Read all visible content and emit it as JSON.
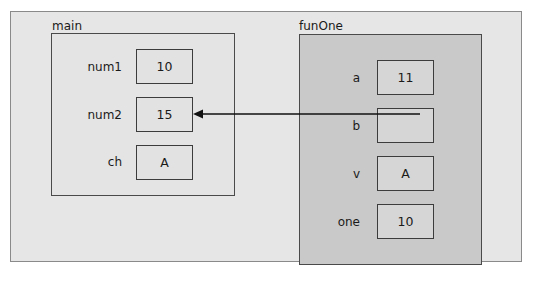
{
  "diagram": {
    "type": "memory-stack-frames",
    "frames": [
      {
        "name": "main",
        "variables": [
          {
            "name": "num1",
            "value": "10"
          },
          {
            "name": "num2",
            "value": "15"
          },
          {
            "name": "ch",
            "value": "A"
          }
        ]
      },
      {
        "name": "funOne",
        "variables": [
          {
            "name": "a",
            "value": "11"
          },
          {
            "name": "b",
            "value": ""
          },
          {
            "name": "v",
            "value": "A"
          },
          {
            "name": "one",
            "value": "10"
          }
        ]
      }
    ],
    "arrows": [
      {
        "from": "funOne.b",
        "to": "main.num2",
        "meaning": "reference parameter"
      }
    ],
    "colors": {
      "frame_bg": "#e6e6e6",
      "main_bg": "#e4e4e4",
      "funone_bg": "#c9c9c9",
      "border": "#3c3c3c"
    }
  }
}
